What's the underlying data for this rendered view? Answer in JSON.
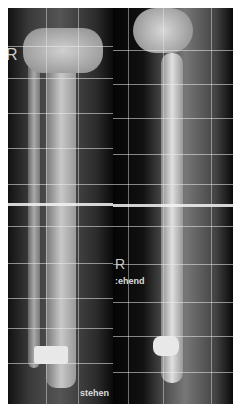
{
  "image": {
    "description": "Two radiographs of a right lower leg (AP and lateral views) with calibration grid lines, showing tibia and fibula with an ankle prosthesis/implant",
    "left_view": {
      "side_marker": "R",
      "label": "stehen"
    },
    "right_view": {
      "side_marker": "R",
      "label": ":ehend"
    },
    "colors": {
      "background": "#050505",
      "bone": "#b8b8b8",
      "grid": "#ebebeb",
      "border": "#ffffff"
    }
  }
}
